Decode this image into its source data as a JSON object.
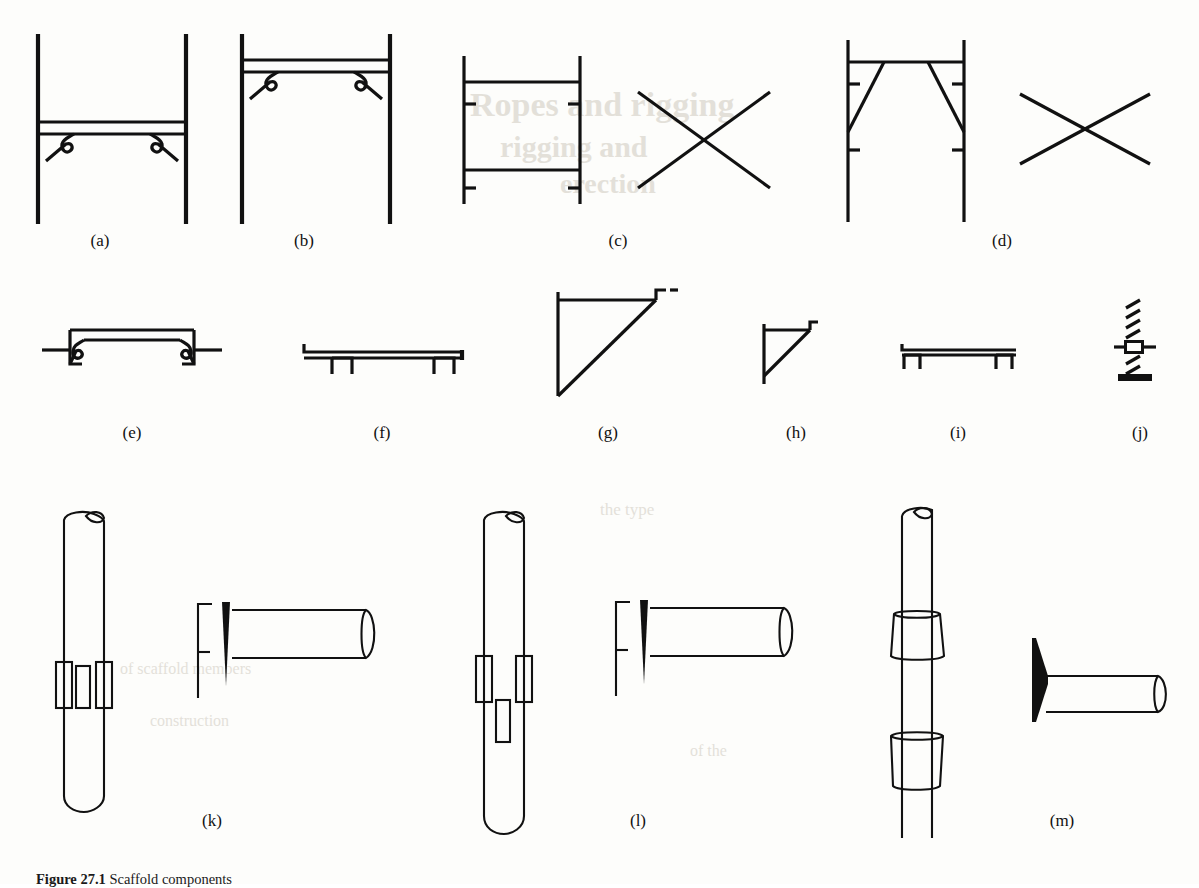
{
  "figure": {
    "caption_number": "Figure 27.1",
    "caption_text": "Scaffold components",
    "panel_count": 13
  },
  "panels": [
    {
      "id": "a",
      "label": "(a)",
      "name": "frame-with-mid-transom-hook-connectors",
      "description": "Pair of vertical standards joined by a horizontal transom at mid height with S-hook wedge end connectors"
    },
    {
      "id": "b",
      "label": "(b)",
      "name": "frame-with-top-transom-hook-connectors",
      "description": "Pair of vertical standards joined by a horizontal transom near the top with S-hook wedge end connectors"
    },
    {
      "id": "c",
      "label": "(c)",
      "name": "prefabricated-frame-with-x-brace",
      "description": "Rectangular prefabricated frame with four stub spigots plus a separate X cross brace"
    },
    {
      "id": "d",
      "label": "(d)",
      "name": "frame-with-v-bracing-and-x-brace",
      "description": "Frame with inclined V bracing to the standards plus a separate X cross brace"
    },
    {
      "id": "e",
      "label": "(e)",
      "name": "transom-with-hook-end-connectors",
      "description": "Single transom member with downturned S-hook claw connectors at both ends"
    },
    {
      "id": "f",
      "label": "(f)",
      "name": "long-board-bearer-with-claws",
      "description": "Long platform bearer with two downward hook claws"
    },
    {
      "id": "g",
      "label": "(g)",
      "name": "large-triangular-bracket",
      "description": "Large right-angle triangular cantilever bracket with diagonal strut"
    },
    {
      "id": "h",
      "label": "(h)",
      "name": "small-triangular-bracket",
      "description": "Small right-angle triangular cantilever bracket with diagonal strut"
    },
    {
      "id": "i",
      "label": "(i)",
      "name": "short-board-bearer-with-claws",
      "description": "Short platform bearer with two downward hook claws"
    },
    {
      "id": "j",
      "label": "(j)",
      "name": "adjustable-base-jack",
      "description": "Threaded adjustable base jack with wing nut and base plate"
    },
    {
      "id": "k",
      "label": "(k)",
      "name": "standard-with-three-lugs-and-wedge-ledger",
      "description": "Vertical tube standard with three rectangular lug plates, shown with a ledger tube having a forked wedge end"
    },
    {
      "id": "l",
      "label": "(l)",
      "name": "standard-with-offset-lugs-and-wedge-ledger",
      "description": "Vertical tube standard with two side lugs and one lower offset lug, shown with a ledger tube having a forked wedge end"
    },
    {
      "id": "m",
      "label": "(m)",
      "name": "cuplock-standard-and-blade-end-ledger",
      "description": "Vertical tube standard with two conical cup collars, shown with a ledger tube having a solid blade end plate"
    }
  ],
  "colors": {
    "ink": "#111111",
    "paper": "#fdfdfb",
    "bleed_text": "#cfcabf"
  },
  "bleed_text": {
    "lines": [
      "Ropes and rigging",
      "rigging and",
      "erection",
      "the type",
      "of scaffold members",
      "construction",
      "of the"
    ]
  }
}
